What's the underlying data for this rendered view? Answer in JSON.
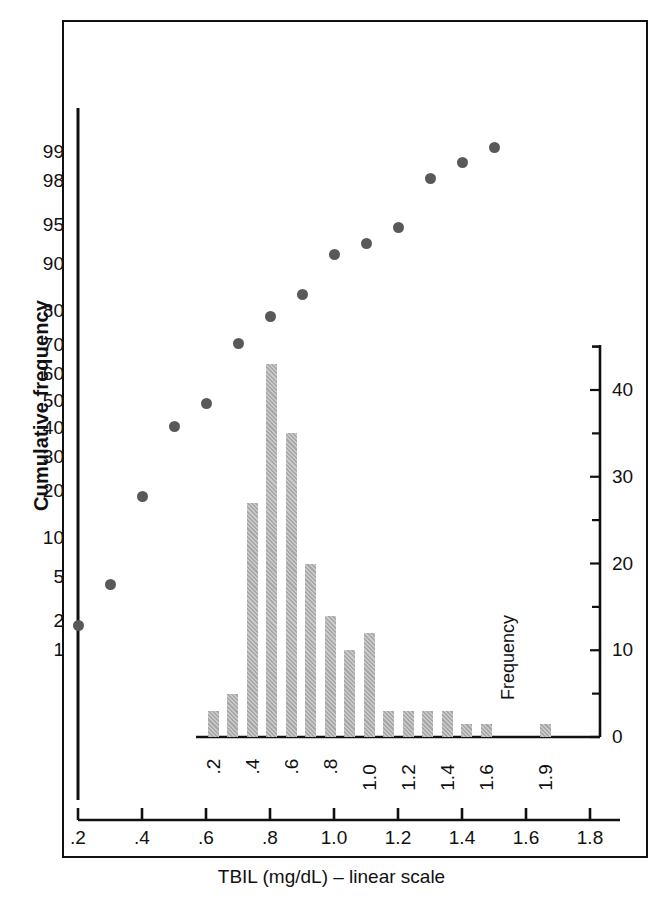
{
  "chart_data": {
    "type": "scatter",
    "title": "",
    "xlabel": "TBIL (mg/dL) – linear scale",
    "ylabel_left": "Cumulative frequency",
    "ylabel_right": "Frequency",
    "xlim": [
      0.15,
      1.92
    ],
    "x_ticks": [
      ".2",
      ".4",
      ".6",
      ".8",
      "1.0",
      "1.2",
      "1.4",
      "1.6",
      "1.8"
    ],
    "x_tick_values": [
      0.2,
      0.4,
      0.6,
      0.8,
      1.0,
      1.2,
      1.4,
      1.6,
      1.8
    ],
    "y_left_scale": "normal probability",
    "y_left_ticks": [
      "1",
      "2",
      "5",
      "10",
      "20",
      "30",
      "40",
      "50",
      "60",
      "70",
      "80",
      "90",
      "95",
      "98",
      "99"
    ],
    "y_left_tick_values": [
      1,
      2,
      5,
      10,
      20,
      30,
      40,
      50,
      60,
      70,
      80,
      90,
      95,
      98,
      99
    ],
    "y_right_ticks": [
      "0",
      "10",
      "20",
      "30",
      "40"
    ],
    "y_right_tick_values": [
      0,
      10,
      20,
      30,
      40
    ],
    "y_right_lim": [
      0,
      46
    ],
    "grid": false,
    "legend": false,
    "series": [
      {
        "name": "Cumulative frequency",
        "type": "scatter",
        "marker": "filled-circle",
        "color": "#58595b",
        "points": [
          {
            "x": 0.2,
            "y": 1.8
          },
          {
            "x": 0.3,
            "y": 4.3
          },
          {
            "x": 0.4,
            "y": 18.5
          },
          {
            "x": 0.5,
            "y": 40.5
          },
          {
            "x": 0.6,
            "y": 49.0
          },
          {
            "x": 0.7,
            "y": 70.5
          },
          {
            "x": 0.8,
            "y": 78.5
          },
          {
            "x": 0.9,
            "y": 84.0
          },
          {
            "x": 1.0,
            "y": 91.5
          },
          {
            "x": 1.1,
            "y": 93.0
          },
          {
            "x": 1.2,
            "y": 94.7
          },
          {
            "x": 1.3,
            "y": 98.1
          },
          {
            "x": 1.4,
            "y": 98.7
          },
          {
            "x": 1.5,
            "y": 99.1
          }
        ]
      },
      {
        "name": "Frequency histogram",
        "type": "bar",
        "color": "#b3b3b3",
        "bin_labels": [
          ".2",
          "",
          ".4",
          "",
          ".6",
          "",
          ".8",
          "",
          "1.0",
          "",
          "1.2",
          "",
          "1.4",
          "",
          "1.6",
          "",
          "1.9"
        ],
        "bins": [
          {
            "x": 0.2,
            "label": ".2",
            "value": 3
          },
          {
            "x": 0.3,
            "label": "",
            "value": 5
          },
          {
            "x": 0.4,
            "label": ".4",
            "value": 27
          },
          {
            "x": 0.5,
            "label": "",
            "value": 43
          },
          {
            "x": 0.6,
            "label": ".6",
            "value": 35
          },
          {
            "x": 0.7,
            "label": "",
            "value": 20
          },
          {
            "x": 0.8,
            "label": ".8",
            "value": 14
          },
          {
            "x": 0.9,
            "label": "",
            "value": 10
          },
          {
            "x": 1.0,
            "label": "1.0",
            "value": 12
          },
          {
            "x": 1.1,
            "label": "",
            "value": 3
          },
          {
            "x": 1.2,
            "label": "1.2",
            "value": 3
          },
          {
            "x": 1.3,
            "label": "",
            "value": 3
          },
          {
            "x": 1.4,
            "label": "1.4",
            "value": 3
          },
          {
            "x": 1.5,
            "label": "",
            "value": 1.5
          },
          {
            "x": 1.6,
            "label": "1.6",
            "value": 1.5
          },
          {
            "x": 1.75,
            "label": "",
            "value": 0
          },
          {
            "x": 1.9,
            "label": "1.9",
            "value": 1.5
          }
        ]
      }
    ]
  }
}
